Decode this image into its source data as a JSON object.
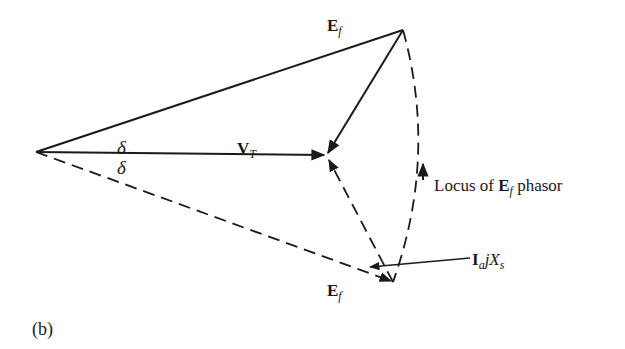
{
  "figure": {
    "caption": "(b)",
    "points": {
      "origin": [
        36,
        152
      ],
      "ef_top": [
        403,
        30
      ],
      "vt_tip": [
        326,
        155
      ],
      "ef_bottom": [
        393,
        282
      ]
    },
    "labels": {
      "ef_top": {
        "main": "E",
        "sub": "f"
      },
      "ef_bottom": {
        "main": "E",
        "sub": "f"
      },
      "vt": {
        "main": "V",
        "sub": "T"
      },
      "delta_upper": "δ",
      "delta_lower": "δ",
      "locus": {
        "prefix": "Locus of ",
        "main": "E",
        "sub": "f",
        "suffix": " phasor"
      },
      "iajxs": {
        "main": "I",
        "sub": "a",
        "j": "j",
        "x": "X",
        "xsub": "s"
      }
    },
    "line_color": "#1a1a1a"
  }
}
